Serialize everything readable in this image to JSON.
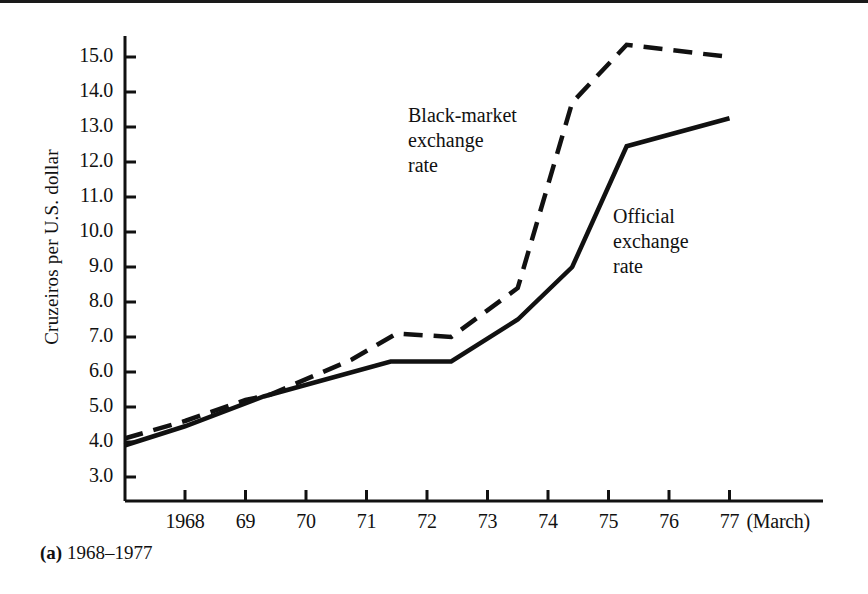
{
  "figure": {
    "caption_tag": "(a)",
    "caption_text": "1968–1977",
    "axis_color": "#111111"
  },
  "chart_data": {
    "type": "line",
    "title": "",
    "subtitle": "",
    "xlabel": "",
    "ylabel": "Cruzeiros per U.S. dollar",
    "x_unit_note": "(March)",
    "grid": false,
    "legend_position": "inline-annotations",
    "xlim": [
      1967.0,
      1978.55
    ],
    "ylim": [
      2.45,
      15.6
    ],
    "yticks": [
      3.0,
      4.0,
      5.0,
      6.0,
      7.0,
      8.0,
      9.0,
      10.0,
      11.0,
      12.0,
      13.0,
      14.0,
      15.0
    ],
    "ytick_labels": [
      "3.0",
      "4.0",
      "5.0",
      "6.0",
      "7.0",
      "8.0",
      "9.0",
      "10.0",
      "11.0",
      "12.0",
      "13.0",
      "14.0",
      "15.0"
    ],
    "xticks": [
      1968,
      1969,
      1970,
      1971,
      1972,
      1973,
      1974,
      1975,
      1976,
      1977
    ],
    "xtick_labels": [
      "1968",
      "69",
      "70",
      "71",
      "72",
      "73",
      "74",
      "75",
      "76",
      "77"
    ],
    "series": [
      {
        "name": "Black-market exchange rate",
        "style": "dashed",
        "color": "#111111",
        "annotation": "Black-market\nexchange\nrate",
        "points": [
          {
            "x": 1967.0,
            "y": 4.1
          },
          {
            "x": 1968.0,
            "y": 4.6
          },
          {
            "x": 1969.0,
            "y": 5.2
          },
          {
            "x": 1969.4,
            "y": 5.35
          },
          {
            "x": 1970.75,
            "y": 6.35
          },
          {
            "x": 1971.5,
            "y": 7.1
          },
          {
            "x": 1972.4,
            "y": 7.0
          },
          {
            "x": 1973.5,
            "y": 8.4
          },
          {
            "x": 1974.4,
            "y": 13.7
          },
          {
            "x": 1975.3,
            "y": 15.35
          },
          {
            "x": 1977.0,
            "y": 15.0
          }
        ]
      },
      {
        "name": "Official exchange rate",
        "style": "solid",
        "color": "#111111",
        "annotation": "Official\nexchange\nrate",
        "points": [
          {
            "x": 1967.0,
            "y": 3.9
          },
          {
            "x": 1968.0,
            "y": 4.45
          },
          {
            "x": 1969.3,
            "y": 5.3
          },
          {
            "x": 1971.4,
            "y": 6.3
          },
          {
            "x": 1972.4,
            "y": 6.3
          },
          {
            "x": 1973.5,
            "y": 7.5
          },
          {
            "x": 1974.4,
            "y": 9.0
          },
          {
            "x": 1975.3,
            "y": 12.45
          },
          {
            "x": 1977.0,
            "y": 13.25
          }
        ]
      }
    ],
    "annotations": [
      {
        "text": "Black-market\nexchange\nrate",
        "x_px": 408,
        "y_px": 103
      },
      {
        "text": "Official\nexchange\nrate",
        "x_px": 613,
        "y_px": 204
      }
    ]
  }
}
